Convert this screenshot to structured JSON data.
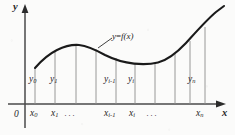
{
  "figure": {
    "background_color": "#fbfbfa",
    "ink_color": "#1e1e1e",
    "thin_line_color": "#8a8a8a",
    "axes": {
      "y_axis_label": "y",
      "x_axis_label": "x",
      "origin_label": "0",
      "x_axis_y_px": 104,
      "y_axis_x_px": 25
    },
    "curve": {
      "label_text": "y",
      "label_equals": "=",
      "label_function": "f(x)",
      "label_full": "y = f(x)",
      "leader_line": true,
      "description": "smooth curve rising from left, local maximum near x=75, local minimum near x=150, then rising steeply to upper right",
      "color": "#1a1a1a",
      "stroke_width": 2.1,
      "points": [
        {
          "x": 35,
          "y": 68
        },
        {
          "x": 45,
          "y": 57
        },
        {
          "x": 56,
          "y": 50
        },
        {
          "x": 68,
          "y": 46
        },
        {
          "x": 78,
          "y": 45
        },
        {
          "x": 90,
          "y": 47
        },
        {
          "x": 103,
          "y": 52
        },
        {
          "x": 116,
          "y": 58
        },
        {
          "x": 130,
          "y": 62
        },
        {
          "x": 143,
          "y": 64
        },
        {
          "x": 152,
          "y": 64
        },
        {
          "x": 163,
          "y": 61
        },
        {
          "x": 175,
          "y": 54
        },
        {
          "x": 188,
          "y": 43
        },
        {
          "x": 200,
          "y": 30
        },
        {
          "x": 212,
          "y": 18
        },
        {
          "x": 222,
          "y": 11
        }
      ]
    },
    "ordinates": [
      {
        "name": "y0",
        "x_px": 35,
        "top_y_px": 68,
        "label": "y",
        "sub": "0",
        "label_x_px": 29,
        "label_y_px": 81
      },
      {
        "name": "y1",
        "x_px": 55,
        "top_y_px": 51,
        "label": "y",
        "sub": "1",
        "label_x_px": 50,
        "label_y_px": 81
      },
      {
        "name": "yA",
        "x_px": 76,
        "top_y_px": 45,
        "label": "",
        "sub": "",
        "label_x_px": 0,
        "label_y_px": 0
      },
      {
        "name": "yB",
        "x_px": 96,
        "top_y_px": 49,
        "label": "",
        "sub": "",
        "label_x_px": 0,
        "label_y_px": 0
      },
      {
        "name": "yi1",
        "x_px": 116,
        "top_y_px": 58,
        "label": "y",
        "sub": "i-1",
        "label_x_px": 107,
        "label_y_px": 81
      },
      {
        "name": "yi",
        "x_px": 135,
        "top_y_px": 63,
        "label": "y",
        "sub": "i",
        "label_x_px": 131,
        "label_y_px": 81
      },
      {
        "name": "yC",
        "x_px": 155,
        "top_y_px": 64,
        "label": "",
        "sub": "",
        "label_x_px": 0,
        "label_y_px": 0
      },
      {
        "name": "yD",
        "x_px": 175,
        "top_y_px": 54,
        "label": "",
        "sub": "",
        "label_x_px": 0,
        "label_y_px": 0
      },
      {
        "name": "yE",
        "x_px": 190,
        "top_y_px": 41,
        "label": "",
        "sub": "",
        "label_x_px": 0,
        "label_y_px": 0
      },
      {
        "name": "yn",
        "x_px": 205,
        "top_y_px": 27,
        "label": "y",
        "sub": "n",
        "label_x_px": 190,
        "label_y_px": 81
      }
    ],
    "abscissas": [
      {
        "name": "x0",
        "x_px": 35,
        "label": "x",
        "sub": "0",
        "label_x_px": 30,
        "label_y_px": 115
      },
      {
        "name": "x1",
        "x_px": 55,
        "label": "x",
        "sub": "1",
        "label_x_px": 52,
        "label_y_px": 115
      },
      {
        "name": "xi1",
        "x_px": 116,
        "label": "x",
        "sub": "i-1",
        "label_x_px": 107,
        "label_y_px": 115
      },
      {
        "name": "xi",
        "x_px": 135,
        "label": "x",
        "sub": "i",
        "label_x_px": 131,
        "label_y_px": 115
      },
      {
        "name": "xn",
        "x_px": 205,
        "label": "x",
        "sub": "n",
        "label_x_px": 196,
        "label_y_px": 115
      }
    ],
    "ellipses": [
      {
        "name": "dots-after-x1",
        "text": "···",
        "x_px": 66,
        "y_px": 114
      },
      {
        "name": "dots-after-xi",
        "text": "···",
        "x_px": 148,
        "y_px": 114
      }
    ],
    "curve_label_pos": {
      "x_px": 112,
      "y_px": 37
    },
    "leader": {
      "x1": 98,
      "y1": 48,
      "x2": 110,
      "y2": 40
    }
  }
}
